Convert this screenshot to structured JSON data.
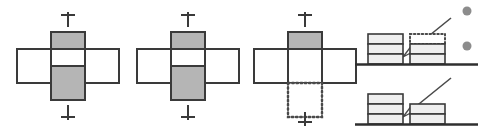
{
  "figure": {
    "width": 492,
    "height": 132,
    "background_color": "#ffffff"
  },
  "style": {
    "stroke_color": "#3a3a3a",
    "stroke_color_light": "#555555",
    "fill_shaded": "#b5b5b5",
    "fill_empty": "#ffffff",
    "fill_light": "#efefef",
    "dot_color": "#8c8c8c",
    "ground_color": "#2f2f2f",
    "dotted_color": "#4a4a4a",
    "stroke_width": 2,
    "thin_stroke_width": 1.2
  },
  "panels": [
    {
      "id": "cross-panel-1",
      "label": "cross diagram 1",
      "cell_size": 34,
      "center": {
        "x": 68,
        "y": 66
      },
      "arms": [
        {
          "name": "top-arm",
          "fill": "shaded",
          "border": "solid"
        },
        {
          "name": "left-arm",
          "fill": "empty",
          "border": "solid"
        },
        {
          "name": "center-arm",
          "fill": "empty",
          "border": "solid"
        },
        {
          "name": "right-arm",
          "fill": "empty",
          "border": "solid"
        },
        {
          "name": "bottom-arm",
          "fill": "shaded",
          "border": "solid"
        }
      ],
      "markers": {
        "top": {
          "name": "top-tick-marker",
          "visible": true
        },
        "bottom": {
          "name": "bottom-tick-marker",
          "visible": true
        },
        "left": {
          "name": "left-up-arrow-marker",
          "visible": true
        }
      }
    },
    {
      "id": "cross-panel-2",
      "label": "cross diagram 2",
      "cell_size": 34,
      "center": {
        "x": 188,
        "y": 66
      },
      "arms": [
        {
          "name": "top-arm",
          "fill": "shaded",
          "border": "solid"
        },
        {
          "name": "left-arm",
          "fill": "empty",
          "border": "solid"
        },
        {
          "name": "center-arm",
          "fill": "empty",
          "border": "solid"
        },
        {
          "name": "right-arm",
          "fill": "empty",
          "border": "solid"
        },
        {
          "name": "bottom-arm",
          "fill": "shaded",
          "border": "solid"
        }
      ],
      "markers": {
        "top": {
          "name": "top-tick-marker",
          "visible": true
        },
        "bottom": {
          "name": "bottom-tick-marker",
          "visible": true
        },
        "left": {
          "name": "left-up-arrow-marker",
          "visible": false
        }
      }
    },
    {
      "id": "cross-panel-3",
      "label": "cross diagram 3",
      "cell_size": 34,
      "center": {
        "x": 305,
        "y": 66
      },
      "arms": [
        {
          "name": "top-arm",
          "fill": "shaded",
          "border": "solid"
        },
        {
          "name": "left-arm",
          "fill": "empty",
          "border": "solid"
        },
        {
          "name": "center-arm",
          "fill": "empty",
          "border": "solid"
        },
        {
          "name": "right-arm",
          "fill": "empty",
          "border": "solid"
        },
        {
          "name": "bottom-arm",
          "fill": "empty",
          "border": "dotted"
        }
      ],
      "markers": {
        "top": {
          "name": "top-tick-marker",
          "visible": true
        },
        "bottom": {
          "name": "bottom-tick-marker",
          "visible": true
        },
        "left": {
          "name": "left-up-arrow-marker",
          "visible": false
        }
      }
    }
  ],
  "stack_panels": [
    {
      "id": "stack-panel-top",
      "label": "stacked bars state A",
      "ground_y": 64,
      "ground_x1": 355,
      "ground_x2": 478,
      "stacks": [
        {
          "name": "left-stack",
          "x": 368,
          "width": 35,
          "segment_height": 10,
          "segments": [
            {
              "border": "solid",
              "fill": "light"
            },
            {
              "border": "solid",
              "fill": "light"
            },
            {
              "border": "solid",
              "fill": "light"
            }
          ]
        },
        {
          "name": "right-stack",
          "x": 410,
          "width": 35,
          "segment_height": 10,
          "segments": [
            {
              "border": "solid",
              "fill": "light"
            },
            {
              "border": "solid",
              "fill": "light"
            },
            {
              "border": "dotted",
              "fill": "empty"
            }
          ]
        }
      ],
      "arrow": {
        "name": "move-arrow",
        "from": {
          "x": 451,
          "y": 18
        },
        "to": {
          "x": 404,
          "y": 56
        },
        "head": "open-triangle"
      }
    },
    {
      "id": "stack-panel-bottom",
      "label": "stacked bars state B",
      "ground_y": 124,
      "ground_x1": 355,
      "ground_x2": 478,
      "stacks": [
        {
          "name": "left-stack",
          "x": 368,
          "width": 35,
          "segment_height": 10,
          "segments": [
            {
              "border": "solid",
              "fill": "light"
            },
            {
              "border": "solid",
              "fill": "light"
            },
            {
              "border": "solid",
              "fill": "light"
            }
          ]
        },
        {
          "name": "right-stack",
          "x": 410,
          "width": 35,
          "segment_height": 10,
          "segments": [
            {
              "border": "solid",
              "fill": "light"
            },
            {
              "border": "solid",
              "fill": "light"
            }
          ]
        }
      ],
      "arrow": {
        "name": "move-arrow",
        "from": {
          "x": 451,
          "y": 78
        },
        "to": {
          "x": 404,
          "y": 116
        },
        "head": "open-triangle"
      }
    }
  ],
  "ellipsis_dots": [
    {
      "name": "continuation-dot-1",
      "cx": 467,
      "cy": 11,
      "r": 4.5
    },
    {
      "name": "continuation-dot-2",
      "cx": 467,
      "cy": 46,
      "r": 4.5
    }
  ]
}
